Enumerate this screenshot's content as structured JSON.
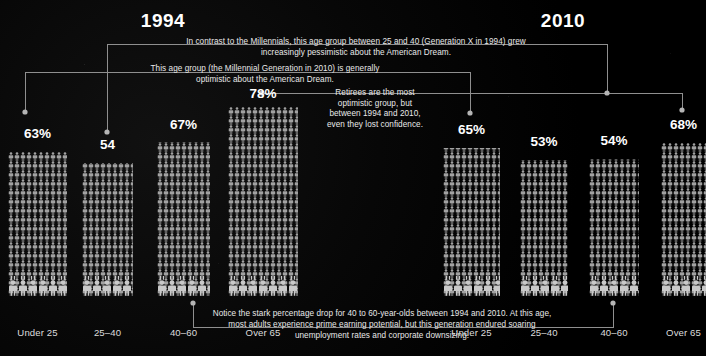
{
  "title": "",
  "theme": {
    "background": "#000000",
    "text": "#ffffff",
    "annotation_text": "#e9e9e9",
    "connector_line": "#9a9a9a",
    "connector_dot": "#b5b5b5",
    "pictogram": "#b9b9b9"
  },
  "panels": [
    {
      "id": "panel-1994",
      "year": "1994"
    },
    {
      "id": "panel-2010",
      "year": "2010"
    }
  ],
  "annotations": [
    {
      "id": "anno-genx",
      "text": "In contrast to the Millennials, this age group between 25 and 40 (Generation X in 1994) grew increasingly pessimistic about the American Dream."
    },
    {
      "id": "anno-millennial",
      "text": "This age group (the Millennial Generation in 2010) is generally optimistic about the American Dream."
    },
    {
      "id": "anno-retirees",
      "text": "Retirees are the most optimistic group, but between 1994 and 2010, even they lost confidence."
    },
    {
      "id": "anno-bottom",
      "text": "Notice the stark percentage drop for 40 to 60-year-olds between 1994 and 2010. At this age, most adults experience prime earning potential, but this generation endured soaring unemployment rates and corporate downsizing."
    }
  ],
  "chart_data": {
    "type": "bar",
    "title": "",
    "subtitle": "",
    "xlabel": "",
    "ylabel": "",
    "ylim": [
      0,
      100
    ],
    "grid": false,
    "legend_position": "none",
    "note": "Pictogram bar chart: each bar is rendered as a dense column of person icons; value = percent optimistic about the American Dream.",
    "categories": [
      "Under 25",
      "25–40",
      "40–60",
      "Over 65"
    ],
    "series": [
      {
        "name": "1994",
        "values": [
          63,
          54,
          67,
          78
        ],
        "labels": [
          "63%",
          "54",
          "67%",
          "78%"
        ]
      },
      {
        "name": "2010",
        "values": [
          65,
          53,
          54,
          68
        ],
        "labels": [
          "65%",
          "53%",
          "54%",
          "68%"
        ]
      }
    ]
  }
}
